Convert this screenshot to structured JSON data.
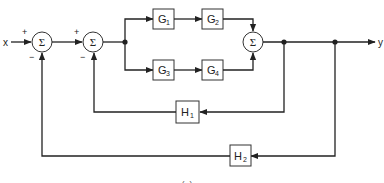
{
  "diagram": {
    "type": "control-system-block-diagram",
    "input": {
      "label": "x"
    },
    "output": {
      "label": "y"
    },
    "summing_junctions": [
      {
        "id": "sum1",
        "symbol": "Σ",
        "signs": {
          "input": "+",
          "feedback": "−"
        }
      },
      {
        "id": "sum2",
        "symbol": "Σ",
        "signs": {
          "input": "+",
          "feedback": "−"
        }
      },
      {
        "id": "sum3",
        "symbol": "Σ"
      }
    ],
    "forward_blocks": [
      {
        "id": "G1",
        "name": "G",
        "sub": "1"
      },
      {
        "id": "G2",
        "name": "G",
        "sub": "2"
      },
      {
        "id": "G3",
        "name": "G",
        "sub": "3"
      },
      {
        "id": "G4",
        "name": "G",
        "sub": "4"
      }
    ],
    "feedback_blocks": [
      {
        "id": "H1",
        "name": "H",
        "sub": "1"
      },
      {
        "id": "H2",
        "name": "H",
        "sub": "2"
      }
    ],
    "caption": "(a)"
  }
}
